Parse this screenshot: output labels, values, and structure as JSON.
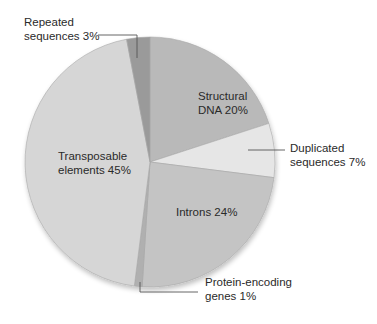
{
  "chart_data": {
    "type": "pie",
    "title": "",
    "start_angle_deg": 0,
    "direction": "clockwise",
    "center": [
      150,
      162
    ],
    "radius": 125,
    "slices": [
      {
        "label": "Structural DNA",
        "value": 20,
        "text_lines": [
          "Structural",
          "DNA 20%"
        ],
        "color": "#b9b9b9",
        "label_pos": [
          198,
          100
        ],
        "label_inside": true
      },
      {
        "label": "Duplicated sequences",
        "value": 7,
        "text_lines": [
          "Duplicated",
          "sequences 7%"
        ],
        "color": "#e6e6e6",
        "label_pos": [
          290,
          152
        ],
        "label_inside": false,
        "leader": [
          [
            248,
            150
          ],
          [
            285,
            150
          ]
        ]
      },
      {
        "label": "Introns",
        "value": 24,
        "text_lines": [
          "Introns 24%"
        ],
        "color": "#c4c4c4",
        "label_pos": [
          176,
          216
        ],
        "label_inside": true
      },
      {
        "label": "Protein-encoding genes",
        "value": 1,
        "text_lines": [
          "Protein-encoding",
          "genes 1%"
        ],
        "color": "#b0b0b0",
        "label_pos": [
          205,
          286
        ],
        "label_inside": false,
        "leader": [
          [
            140,
            282
          ],
          [
            140,
            292
          ],
          [
            198,
            292
          ]
        ]
      },
      {
        "label": "Transposable elements",
        "value": 45,
        "text_lines": [
          "Transposable",
          "elements 45%"
        ],
        "color": "#d6d6d6",
        "label_pos": [
          58,
          160
        ],
        "label_inside": true
      },
      {
        "label": "Repeated sequences",
        "value": 3,
        "text_lines": [
          "Repeated",
          "sequences 3%"
        ],
        "color": "#9a9a9a",
        "label_pos": [
          24,
          26
        ],
        "label_inside": false,
        "leader": [
          [
            98,
            35
          ],
          [
            137,
            35
          ],
          [
            137,
            58
          ]
        ]
      }
    ],
    "legend": null,
    "grid": false
  }
}
